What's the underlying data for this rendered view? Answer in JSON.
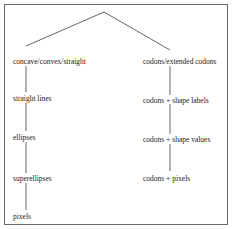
{
  "diagram": {
    "left_branch": {
      "nodes": [
        "concave/convex/straight",
        "straight lines",
        "ellipses",
        "superellipses",
        "pixels"
      ]
    },
    "right_branch": {
      "nodes": [
        "codons/extended codons",
        "codons + shape labels",
        "codons + shape values",
        "codons + pixels"
      ]
    },
    "colors": {
      "line": "#555555",
      "text": "#222222",
      "border": "#6a6a6a"
    }
  }
}
